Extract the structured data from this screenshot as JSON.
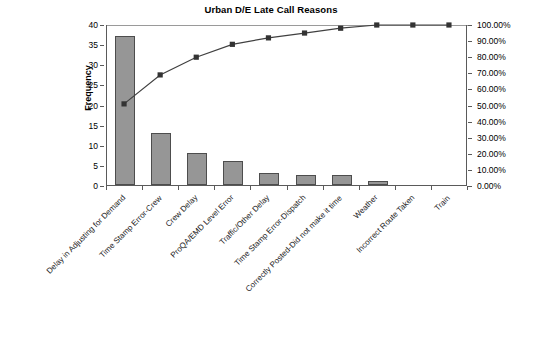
{
  "chart_data": {
    "type": "bar",
    "title": "Urban D/E Late Call Reasons",
    "xlabel": "",
    "ylabel": "Frequency",
    "ylim": [
      0,
      40
    ],
    "ylim2": [
      0,
      1
    ],
    "grid": false,
    "legend": "none",
    "categories": [
      "Delay in Adjusting for Demand",
      "Time Stamp Error-Crew",
      "Crew Delay",
      "ProQA/EMD Level Error",
      "Traffic/Other Delay",
      "Time Stamp Error-Dispatch",
      "Correctly Posted-Did not make it time",
      "Weather",
      "Incorrect Route Taken",
      "Train"
    ],
    "values": [
      37,
      13,
      8,
      6,
      3,
      2.5,
      2.5,
      1,
      0,
      0
    ],
    "cumulative_percent": [
      51,
      69,
      80,
      88,
      92,
      95,
      98,
      100,
      100,
      100
    ],
    "y_ticks": [
      "0",
      "5",
      "10",
      "15",
      "20",
      "25",
      "30",
      "35",
      "40"
    ],
    "y2_ticks": [
      "0.00%",
      "10.00%",
      "20.00%",
      "30.00%",
      "40.00%",
      "50.00%",
      "60.00%",
      "70.00%",
      "80.00%",
      "90.00%",
      "100.00%"
    ],
    "series": [
      {
        "name": "Frequency",
        "type": "bar",
        "values": [
          37,
          13,
          8,
          6,
          3,
          2.5,
          2.5,
          1,
          0,
          0
        ],
        "color": "#969696"
      },
      {
        "name": "Cumulative %",
        "type": "line",
        "values": [
          51,
          69,
          80,
          88,
          92,
          95,
          98,
          100,
          100,
          100
        ],
        "color": "#404040"
      }
    ],
    "colors": {
      "bar_fill": "#969696",
      "bar_border": "#4d4d4d",
      "line": "#404040",
      "marker": "#333333",
      "axis": "#5a5a5a"
    }
  }
}
